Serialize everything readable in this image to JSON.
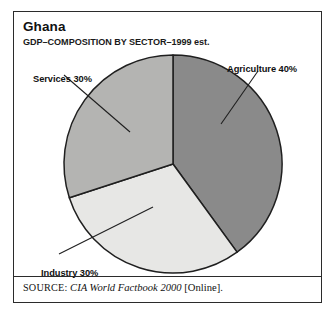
{
  "figure": {
    "title": "Ghana",
    "subtitle": "GDP–COMPOSITION BY SECTOR–1999 est.",
    "source_label": "SOURCE:",
    "source_title": "CIA World Factbook 2000",
    "source_suffix": "[Online].",
    "frame_color": "#2b2b2b",
    "background_color": "#ffffff"
  },
  "chart_data": {
    "type": "pie",
    "title": "Ghana",
    "subtitle": "GDP–COMPOSITION BY SECTOR–1999 est.",
    "xlabel": "",
    "ylabel": "",
    "grid": false,
    "legend_position": "callout-labels",
    "start_angle_deg": 0,
    "direction": "clockwise",
    "categories": [
      "Agriculture",
      "Industry",
      "Services"
    ],
    "values": [
      40,
      30,
      30
    ],
    "units": "percent",
    "total": 100,
    "slices": [
      {
        "name": "Agriculture",
        "value": 40,
        "label": "Agriculture 40%",
        "color": "#8a8a8a",
        "start_deg": 0,
        "end_deg": 144
      },
      {
        "name": "Industry",
        "value": 30,
        "label": "Industry 30%",
        "color": "#e7e7e5",
        "start_deg": 144,
        "end_deg": 252
      },
      {
        "name": "Services",
        "value": 30,
        "label": "Services 30%",
        "color": "#b4b4b2",
        "start_deg": 252,
        "end_deg": 360
      }
    ]
  },
  "labels": {
    "agriculture": "Agriculture 40%",
    "industry": "Industry 30%",
    "services": "Services 30%"
  }
}
